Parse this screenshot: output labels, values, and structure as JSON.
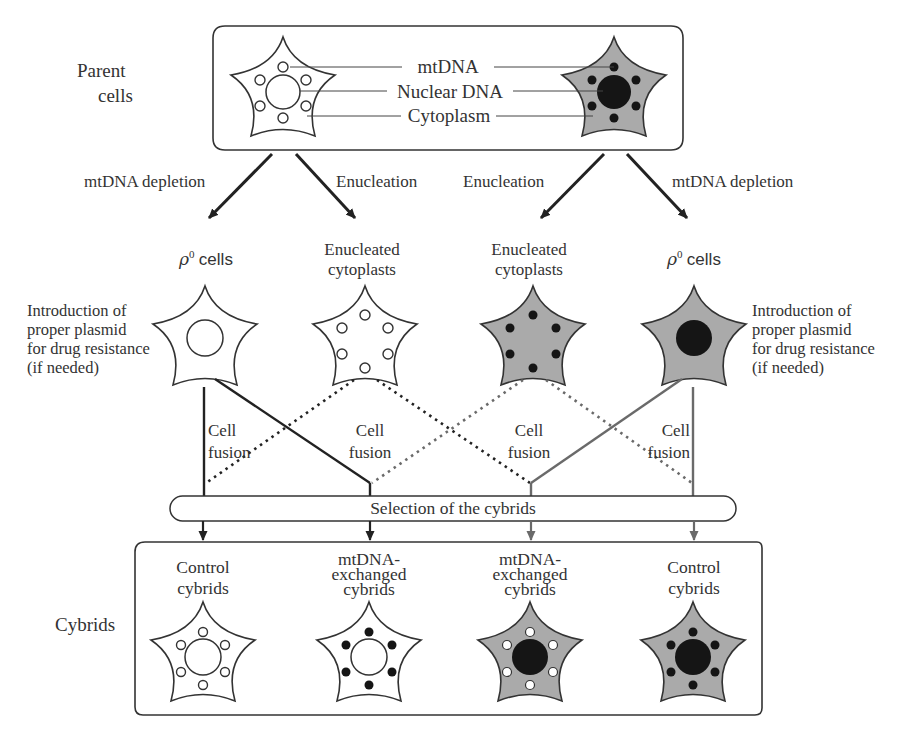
{
  "diagram": {
    "colors": {
      "line_dark": "#2b2b2b",
      "line_gray": "#6a6a6a",
      "cytoplasm_gray": "#aaaaaa",
      "organelle_black": "#151515",
      "background": "#ffffff"
    }
  },
  "parent_section": {
    "label_line1": "Parent",
    "label_line2": "cells",
    "legend": {
      "mtdna": "mtDNA",
      "nuclear_dna": "Nuclear DNA",
      "cytoplasm": "Cytoplasm"
    }
  },
  "branches": {
    "left_depletion": "mtDNA depletion",
    "left_enucleation": "Enucleation",
    "right_enucleation": "Enucleation",
    "right_depletion": "mtDNA depletion"
  },
  "intermediates": {
    "rho0_left": {
      "symbol": "ρ",
      "superscript": "0",
      "text": "cells"
    },
    "cytoplast_left": {
      "line1": "Enucleated",
      "line2": "cytoplasts"
    },
    "cytoplast_right": {
      "line1": "Enucleated",
      "line2": "cytoplasts"
    },
    "rho0_right": {
      "symbol": "ρ",
      "superscript": "0",
      "text": "cells"
    }
  },
  "plasmid_note": {
    "left": [
      "Introduction of",
      "proper plasmid",
      "for drug resistance",
      "(if needed)"
    ],
    "right": [
      "Introduction of",
      "proper plasmid",
      "for drug resistance",
      "(if needed)"
    ]
  },
  "fusion": {
    "labels": [
      {
        "line1": "Cell",
        "line2": "fusion"
      },
      {
        "line1": "Cell",
        "line2": "fusion"
      },
      {
        "line1": "Cell",
        "line2": "fusion"
      },
      {
        "line1": "Cell",
        "line2": "fusion"
      }
    ]
  },
  "selection": {
    "label": "Selection of the cybrids"
  },
  "cybrids_section": {
    "label": "Cybrids",
    "items": [
      {
        "line1": "Control",
        "line2": "cybrids",
        "line3": ""
      },
      {
        "line1": "mtDNA-",
        "line2": "exchanged",
        "line3": "cybrids"
      },
      {
        "line1": "mtDNA-",
        "line2": "exchanged",
        "line3": "cybrids"
      },
      {
        "line1": "Control",
        "line2": "cybrids",
        "line3": ""
      }
    ]
  }
}
